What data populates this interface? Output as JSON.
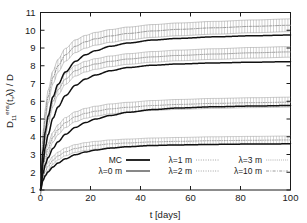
{
  "chart_data": {
    "type": "line",
    "title": "",
    "xlabel": "t [days]",
    "ylabel": "D11ens(t,λ) / D",
    "ylabel_parts": {
      "base": "D",
      "sub": "11",
      "sup": "ens",
      "args": "(t,λ)",
      "denominator": " / D"
    },
    "xlim": [
      0,
      100
    ],
    "ylim": [
      1,
      11
    ],
    "xticks": [
      0,
      20,
      40,
      60,
      80,
      100
    ],
    "yticks": [
      1,
      2,
      3,
      4,
      5,
      6,
      7,
      8,
      9,
      10,
      11
    ],
    "grid": false,
    "legend_position": "lower-center-inside",
    "series": [
      {
        "name": "MC",
        "style": "solid-thick",
        "color": "#111111",
        "has_errorbars": false,
        "x": [
          0,
          1,
          2,
          3,
          5,
          7,
          10,
          14,
          18,
          22,
          28,
          35,
          45,
          55,
          70,
          85,
          100
        ],
        "y": [
          1.0,
          3.2,
          4.35,
          5.15,
          6.25,
          6.95,
          7.65,
          8.25,
          8.62,
          8.85,
          9.1,
          9.28,
          9.45,
          9.54,
          9.63,
          9.69,
          9.73
        ]
      },
      {
        "name": "MC-2",
        "style": "solid-thick",
        "color": "#111111",
        "has_errorbars": false,
        "x": [
          0,
          1,
          2,
          3,
          5,
          7,
          10,
          14,
          18,
          22,
          28,
          35,
          45,
          55,
          70,
          85,
          100
        ],
        "y": [
          1.0,
          2.55,
          3.45,
          4.1,
          5.05,
          5.68,
          6.32,
          6.9,
          7.25,
          7.48,
          7.72,
          7.9,
          8.03,
          8.1,
          8.16,
          8.2,
          8.23
        ]
      },
      {
        "name": "MC-3",
        "style": "solid-thick",
        "color": "#111111",
        "has_errorbars": false,
        "x": [
          0,
          1,
          2,
          3,
          5,
          7,
          10,
          14,
          18,
          22,
          28,
          35,
          45,
          55,
          70,
          85,
          100
        ],
        "y": [
          1.0,
          1.95,
          2.45,
          2.82,
          3.35,
          3.72,
          4.14,
          4.53,
          4.8,
          5.0,
          5.2,
          5.38,
          5.53,
          5.62,
          5.69,
          5.73,
          5.76
        ]
      },
      {
        "name": "MC-4",
        "style": "solid-thick",
        "color": "#111111",
        "has_errorbars": false,
        "x": [
          0,
          1,
          2,
          3,
          5,
          7,
          10,
          14,
          18,
          22,
          28,
          35,
          45,
          55,
          70,
          85,
          100
        ],
        "y": [
          1.0,
          1.55,
          1.82,
          2.02,
          2.3,
          2.52,
          2.76,
          2.99,
          3.14,
          3.25,
          3.36,
          3.44,
          3.51,
          3.54,
          3.57,
          3.59,
          3.6
        ]
      },
      {
        "name": "λ=10 m",
        "style": "dash-dot",
        "color": "#8a8a8a",
        "has_errorbars": true,
        "error": 0.36,
        "x": [
          0,
          1,
          2,
          3,
          5,
          7,
          10,
          14,
          18,
          22,
          28,
          35,
          45,
          55,
          70,
          85,
          100
        ],
        "y": [
          1.0,
          3.95,
          5.35,
          6.25,
          7.35,
          8.0,
          8.62,
          9.1,
          9.35,
          9.52,
          9.68,
          9.82,
          9.96,
          10.05,
          10.14,
          10.22,
          10.28
        ]
      },
      {
        "name": "λ=3 m",
        "style": "dotted-fine",
        "color": "#8f8f8f",
        "has_errorbars": true,
        "error": 0.3,
        "x": [
          0,
          1,
          2,
          3,
          5,
          7,
          10,
          14,
          18,
          22,
          28,
          35,
          45,
          55,
          70,
          85,
          100
        ],
        "y": [
          1.0,
          3.1,
          4.2,
          4.95,
          6.0,
          6.65,
          7.25,
          7.72,
          7.95,
          8.1,
          8.25,
          8.38,
          8.5,
          8.58,
          8.66,
          8.73,
          8.78
        ]
      },
      {
        "name": "λ=2 m",
        "style": "dotted",
        "color": "#909090",
        "has_errorbars": true,
        "error": 0.28,
        "x": [
          0,
          1,
          2,
          3,
          5,
          7,
          10,
          14,
          18,
          22,
          28,
          35,
          45,
          55,
          70,
          85,
          100
        ],
        "y": [
          1.0,
          2.2,
          2.85,
          3.32,
          3.98,
          4.4,
          4.8,
          5.13,
          5.32,
          5.44,
          5.57,
          5.66,
          5.76,
          5.82,
          5.88,
          5.92,
          5.95
        ]
      },
      {
        "name": "λ=1 m",
        "style": "dotted",
        "color": "#949494",
        "has_errorbars": true,
        "error": 0.22,
        "x": [
          0,
          1,
          2,
          3,
          5,
          7,
          10,
          14,
          18,
          22,
          28,
          35,
          45,
          55,
          70,
          85,
          100
        ],
        "y": [
          1.0,
          1.72,
          2.08,
          2.33,
          2.68,
          2.92,
          3.15,
          3.34,
          3.45,
          3.52,
          3.6,
          3.65,
          3.71,
          3.74,
          3.78,
          3.8,
          3.82
        ]
      }
    ]
  },
  "axes": {
    "x_tick_labels": [
      "0",
      "20",
      "40",
      "60",
      "80",
      "100"
    ],
    "y_tick_labels": [
      "1",
      "2",
      "3",
      "4",
      "5",
      "6",
      "7",
      "8",
      "9",
      "10",
      "11"
    ],
    "x_axis_title": "t [days]"
  },
  "legend": {
    "entries": [
      {
        "label": "MC",
        "style": "solid-thick"
      },
      {
        "label": "λ=1 m",
        "style": "dotted"
      },
      {
        "label": "λ=3 m",
        "style": "dotted-fine"
      },
      {
        "label": "λ=0 m",
        "style": "solid-thin"
      },
      {
        "label": "λ=2 m",
        "style": "dotted"
      },
      {
        "label": "λ=10 m",
        "style": "dash-dot"
      }
    ]
  },
  "colors": {
    "frame": "#1a1a1a",
    "curve_black": "#111111",
    "curve_gray": "#8f8f8f",
    "background": "#ffffff"
  }
}
